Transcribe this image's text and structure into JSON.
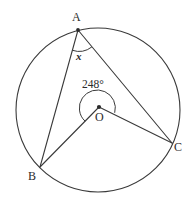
{
  "figure": {
    "type": "circle-geometry-diagram",
    "stroke_color": "#3a3a3a",
    "text_color": "#2b2b2b",
    "background_color": "#ffffff",
    "circle": {
      "center_label": "O",
      "cx": 98,
      "cy": 110,
      "r": 82
    },
    "points": [
      {
        "name": "A",
        "label": "A",
        "x": 78,
        "y": 30
      },
      {
        "name": "B",
        "label": "B",
        "x": 40,
        "y": 167
      },
      {
        "name": "C",
        "label": "C",
        "x": 172,
        "y": 143
      },
      {
        "name": "O",
        "label": "O",
        "x": 99,
        "y": 107
      }
    ],
    "segments": [
      {
        "name": "chord-AB",
        "from": "A",
        "to": "B"
      },
      {
        "name": "chord-AC",
        "from": "A",
        "to": "C"
      },
      {
        "name": "radius-OB",
        "from": "O",
        "to": "B"
      },
      {
        "name": "radius-OC",
        "from": "O",
        "to": "C"
      }
    ],
    "angles": [
      {
        "name": "inscribed-angle-at-A",
        "vertex": "A",
        "label": "x",
        "value": null,
        "unit": "degrees",
        "marked": true
      },
      {
        "name": "reflex-central-angle-at-O",
        "vertex": "O",
        "label": "248°",
        "value": 248,
        "unit": "degrees",
        "reflex": true,
        "marked": true
      }
    ]
  },
  "labels": {
    "A": "A",
    "B": "B",
    "C": "C",
    "O": "O",
    "x": "x",
    "reflex_angle": "248°"
  }
}
